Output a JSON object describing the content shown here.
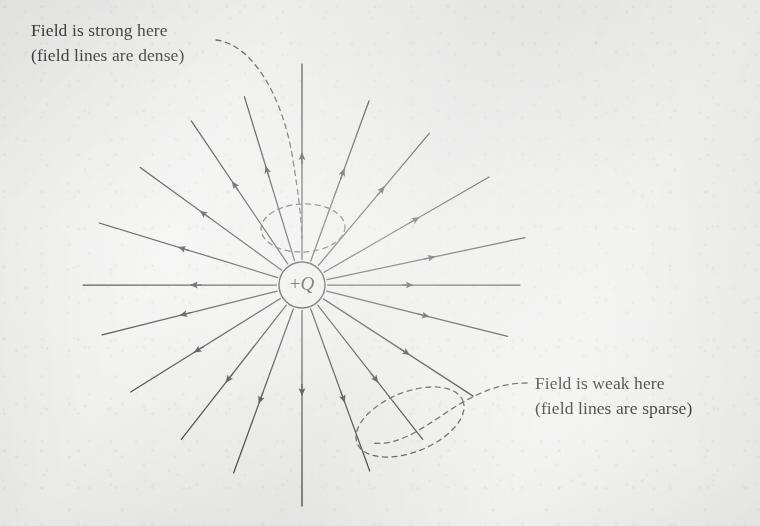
{
  "figure": {
    "kind": "electric-field-line-diagram",
    "background_color": "#f2f2f1",
    "ink_color": "#2b2b2b",
    "width": 760,
    "height": 526
  },
  "charge": {
    "label_sign": "+",
    "label_symbol": "Q",
    "full_label": "+Q",
    "center_x": 302,
    "center_y": 285,
    "radius": 23
  },
  "annotations": [
    {
      "id": "strong",
      "line1": "Field is strong here",
      "line2": "(field lines are dense)",
      "x": 31,
      "y": 18,
      "leader": "dashed-curve",
      "highlight_region": "dense-lines-near-charge"
    },
    {
      "id": "weak",
      "line1": "Field is weak here",
      "line2": "(field lines are sparse)",
      "x": 535,
      "y": 371,
      "leader": "dashed-curve",
      "highlight_region": "sparse-lines-far-from-charge"
    }
  ],
  "field_lines": {
    "count": 18,
    "direction": "outward",
    "arrow_position_fraction": 0.58,
    "rays": [
      {
        "angle_deg": -90,
        "length": 221,
        "arrow_at": 0.55
      },
      {
        "angle_deg": -70,
        "length": 196,
        "arrow_at": 0.58
      },
      {
        "angle_deg": -50,
        "length": 198,
        "arrow_at": 0.6
      },
      {
        "angle_deg": -30,
        "length": 216,
        "arrow_at": 0.58
      },
      {
        "angle_deg": -12,
        "length": 228,
        "arrow_at": 0.55
      },
      {
        "angle_deg": 0,
        "length": 218,
        "arrow_at": 0.45
      },
      {
        "angle_deg": 14,
        "length": 212,
        "arrow_at": 0.57
      },
      {
        "angle_deg": 33,
        "length": 204,
        "arrow_at": 0.58
      },
      {
        "angle_deg": 52,
        "length": 196,
        "arrow_at": 0.58
      },
      {
        "angle_deg": 70,
        "length": 198,
        "arrow_at": 0.58
      },
      {
        "angle_deg": 90,
        "length": 221,
        "arrow_at": 0.44
      },
      {
        "angle_deg": 110,
        "length": 200,
        "arrow_at": 0.58
      },
      {
        "angle_deg": 128,
        "length": 196,
        "arrow_at": 0.58
      },
      {
        "angle_deg": 148,
        "length": 202,
        "arrow_at": 0.58
      },
      {
        "angle_deg": 166,
        "length": 206,
        "arrow_at": 0.56
      },
      {
        "angle_deg": 180,
        "length": 219,
        "arrow_at": 0.45
      },
      {
        "angle_deg": 197,
        "length": 212,
        "arrow_at": 0.56
      },
      {
        "angle_deg": 216,
        "length": 200,
        "arrow_at": 0.58
      },
      {
        "angle_deg": 236,
        "length": 198,
        "arrow_at": 0.58
      },
      {
        "angle_deg": 253,
        "length": 197,
        "arrow_at": 0.58
      }
    ]
  },
  "dashed_regions": [
    {
      "id": "dense-region",
      "cx": 303,
      "cy": 228,
      "rx": 42,
      "ry": 24,
      "rotate": -2
    },
    {
      "id": "sparse-region",
      "cx": 410,
      "cy": 422,
      "rx": 57,
      "ry": 30,
      "rotate": -22
    }
  ]
}
